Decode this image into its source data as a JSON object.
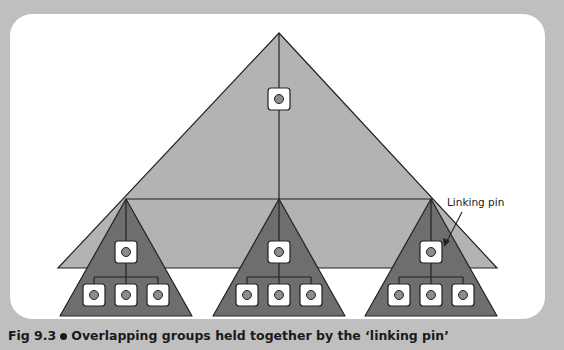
{
  "figure": {
    "number": "Fig 9.3",
    "caption": "Overlapping groups held together by the ‘linking pin’",
    "annotation": "Linking pin"
  },
  "colors": {
    "background": "#bfbfbf",
    "panel": "#ffffff",
    "large_triangle": "#b3b3b3",
    "small_triangles": "#6e6e6e",
    "node_fill": "#ffffff",
    "node_dot": "#8c8c8c",
    "stroke": "#222222"
  },
  "diagram": {
    "top_group": {
      "nodes": 1
    },
    "subgroups": [
      {
        "name": "left-group",
        "leader_nodes": 1,
        "member_nodes": 3
      },
      {
        "name": "middle-group",
        "leader_nodes": 1,
        "member_nodes": 3
      },
      {
        "name": "right-group",
        "leader_nodes": 1,
        "member_nodes": 3
      }
    ]
  }
}
